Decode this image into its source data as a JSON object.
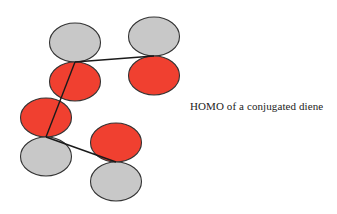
{
  "caption": "HOMO of a conjugated diene",
  "colors": {
    "positive_lobe": "#f04030",
    "negative_lobe": "#c8c8c8",
    "outline": "#333333",
    "bond": "#1a1a1a"
  },
  "orbitals": [
    {
      "atom": "C1",
      "top_phase": "negative",
      "bottom_phase": "positive"
    },
    {
      "atom": "C2",
      "top_phase": "negative",
      "bottom_phase": "positive"
    },
    {
      "atom": "C3",
      "top_phase": "positive",
      "bottom_phase": "negative"
    },
    {
      "atom": "C4",
      "top_phase": "positive",
      "bottom_phase": "negative"
    }
  ],
  "bonds": [
    {
      "from": "C1",
      "to": "C2"
    },
    {
      "from": "C1",
      "to": "C3"
    },
    {
      "from": "C3",
      "to": "C4"
    }
  ]
}
